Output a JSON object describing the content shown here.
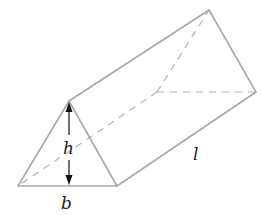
{
  "diagram": {
    "type": "triangular-prism",
    "labels": {
      "height": "h",
      "base": "b",
      "length": "l"
    },
    "colors": {
      "edge": "#a8a8a8",
      "hidden_edge": "#b4b4b4",
      "dimension_arrow": "#111111",
      "label": "#222222"
    }
  }
}
